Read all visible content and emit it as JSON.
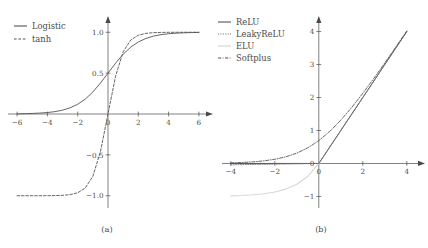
{
  "figure": {
    "background_color": "#ffffff",
    "axis_color": "#4a4a4a",
    "panels": [
      "(a)",
      "(b)"
    ]
  },
  "chart_data": [
    {
      "type": "line",
      "panel": "a",
      "caption": "(a)",
      "title": "",
      "xlabel": "",
      "ylabel": "",
      "xlim": [
        -6.6,
        6.6
      ],
      "ylim": [
        -1.15,
        1.15
      ],
      "xticks": [
        -6,
        -4,
        -2,
        0,
        2,
        4,
        6
      ],
      "xtick_labels": [
        "−6",
        "−4",
        "−2",
        "0",
        "2",
        "4",
        "6"
      ],
      "yticks": [
        1.0,
        0.5,
        -0.5,
        -1.0
      ],
      "ytick_labels": [
        "1.0",
        "0.5",
        "−0.5",
        "−1.0"
      ],
      "grid": false,
      "legend_position": "top-left",
      "axis_style": "arrowed-spines-at-zero",
      "series": [
        {
          "name": "Logistic",
          "style": "solid",
          "color": "#555555",
          "width": 0.9,
          "formula": "1/(1+exp(-x))",
          "x": [
            -6,
            -5.5,
            -5,
            -4.5,
            -4,
            -3.5,
            -3,
            -2.5,
            -2,
            -1.5,
            -1,
            -0.5,
            0,
            0.5,
            1,
            1.5,
            2,
            2.5,
            3,
            3.5,
            4,
            4.5,
            5,
            5.5,
            6
          ],
          "y": [
            0.002,
            0.004,
            0.007,
            0.011,
            0.018,
            0.029,
            0.047,
            0.076,
            0.119,
            0.182,
            0.269,
            0.378,
            0.5,
            0.622,
            0.731,
            0.818,
            0.881,
            0.924,
            0.953,
            0.971,
            0.982,
            0.989,
            0.993,
            0.996,
            0.998
          ]
        },
        {
          "name": "tanh",
          "style": "dashed",
          "color": "#555555",
          "width": 0.9,
          "formula": "tanh(x)",
          "x": [
            -6,
            -5.5,
            -5,
            -4.5,
            -4,
            -3.5,
            -3,
            -2.5,
            -2,
            -1.5,
            -1,
            -0.5,
            0,
            0.5,
            1,
            1.5,
            2,
            2.5,
            3,
            3.5,
            4,
            4.5,
            5,
            5.5,
            6
          ],
          "y": [
            -1.0,
            -1.0,
            -0.9999,
            -0.9998,
            -0.9993,
            -0.9982,
            -0.995,
            -0.9866,
            -0.964,
            -0.9051,
            -0.7616,
            -0.4621,
            0.0,
            0.4621,
            0.7616,
            0.9051,
            0.964,
            0.9866,
            0.995,
            0.9982,
            0.9993,
            0.9998,
            0.9999,
            1.0,
            1.0
          ]
        }
      ]
    },
    {
      "type": "line",
      "panel": "b",
      "caption": "(b)",
      "title": "",
      "xlabel": "",
      "ylabel": "",
      "xlim": [
        -4.4,
        4.6
      ],
      "ylim": [
        -1.35,
        4.35
      ],
      "xticks": [
        -4,
        -2,
        0,
        2,
        4
      ],
      "xtick_labels": [
        "−4",
        "−2",
        "0",
        "2",
        "4"
      ],
      "yticks": [
        4,
        3,
        2,
        1,
        0,
        -1
      ],
      "ytick_labels": [
        "4",
        "3",
        "2",
        "1",
        "0",
        "−1"
      ],
      "grid": false,
      "legend_position": "top-left",
      "axis_style": "arrowed-spines-at-zero",
      "series": [
        {
          "name": "ReLU",
          "style": "solid",
          "color": "#555555",
          "width": 0.9,
          "formula": "max(0, x)",
          "x": [
            -4,
            -3,
            -2,
            -1,
            0,
            1,
            2,
            3,
            4
          ],
          "y": [
            0,
            0,
            0,
            0,
            0,
            1,
            2,
            3,
            4
          ]
        },
        {
          "name": "LeakyReLU",
          "style": "dotted",
          "color": "#777777",
          "width": 0.9,
          "formula": "max(0.01x, x)",
          "x": [
            -4,
            -3,
            -2,
            -1,
            0,
            1,
            2,
            3,
            4
          ],
          "y": [
            -0.04,
            -0.03,
            -0.02,
            -0.01,
            0,
            1,
            2,
            3,
            4
          ]
        },
        {
          "name": "ELU",
          "style": "solid",
          "color": "#d8d8d8",
          "width": 1.1,
          "formula": "x if x>0 else exp(x)-1",
          "x": [
            -4,
            -3.5,
            -3,
            -2.5,
            -2,
            -1.5,
            -1,
            -0.5,
            0,
            1,
            2,
            3,
            4
          ],
          "y": [
            -0.982,
            -0.97,
            -0.95,
            -0.918,
            -0.865,
            -0.777,
            -0.632,
            -0.393,
            0,
            1,
            2,
            3,
            4
          ]
        },
        {
          "name": "Softplus",
          "style": "dashdot",
          "color": "#555555",
          "width": 0.9,
          "formula": "ln(1+exp(x))",
          "x": [
            -4,
            -3.5,
            -3,
            -2.5,
            -2,
            -1.5,
            -1,
            -0.5,
            0,
            0.5,
            1,
            1.5,
            2,
            2.5,
            3,
            3.5,
            4
          ],
          "y": [
            0.018,
            0.03,
            0.049,
            0.079,
            0.127,
            0.201,
            0.313,
            0.474,
            0.693,
            0.974,
            1.313,
            1.701,
            2.127,
            2.579,
            3.049,
            3.53,
            4.018
          ]
        }
      ]
    }
  ]
}
